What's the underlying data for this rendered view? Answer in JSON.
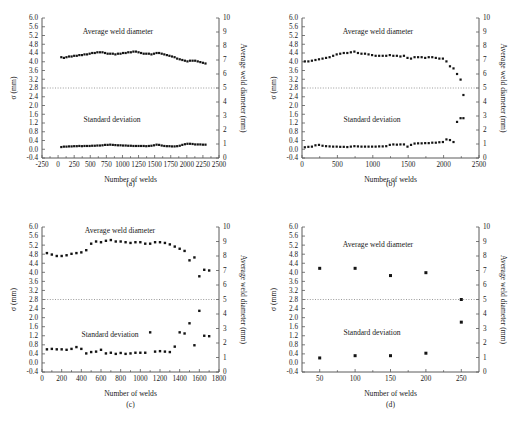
{
  "figure": {
    "name": "weld-diameter-monitoring-figure",
    "axis_titles": {
      "x": "Number of welds",
      "y_left": "σ (mm)",
      "y_right": "Average weld diameter (mm)"
    },
    "series_labels": {
      "upper": "Average weld diameter",
      "lower": "Standard deviation"
    },
    "reference_line_right_value": 5,
    "colors": {
      "marker": "#141414",
      "axis": "#5a5a5a",
      "reference": "#808080",
      "background": "#ffffff"
    }
  },
  "chart_data": [
    {
      "type": "scatter",
      "panel": "a",
      "caption": "(a)",
      "title": "",
      "xlabel": "Number of welds",
      "ylabel": "σ (mm)",
      "y2label": "Average weld diameter (mm)",
      "xlim": [
        -250,
        2500
      ],
      "ylim": [
        -0.4,
        6.0
      ],
      "y2lim": [
        0,
        10
      ],
      "xticks": [
        -250,
        0,
        250,
        500,
        750,
        1000,
        1250,
        1500,
        1750,
        2000,
        2250,
        2500
      ],
      "yticks": [
        -0.4,
        0.0,
        0.4,
        0.8,
        1.2,
        1.6,
        2.0,
        2.4,
        2.8,
        3.2,
        3.6,
        4.0,
        4.4,
        4.8,
        5.2,
        5.6,
        6.0
      ],
      "y2ticks": [
        0,
        1,
        2,
        3,
        4,
        5,
        6,
        7,
        8,
        9,
        10
      ],
      "grid": false,
      "reference_line": {
        "axis": "y2",
        "value": 5
      },
      "series": [
        {
          "name": "Average weld diameter",
          "axis": "right",
          "x": [
            50,
            90,
            130,
            170,
            210,
            250,
            290,
            330,
            370,
            410,
            450,
            490,
            530,
            570,
            610,
            650,
            690,
            730,
            770,
            810,
            850,
            890,
            930,
            970,
            1010,
            1050,
            1090,
            1130,
            1170,
            1210,
            1250,
            1290,
            1330,
            1370,
            1410,
            1450,
            1490,
            1530,
            1570,
            1610,
            1650,
            1690,
            1730,
            1770,
            1810,
            1850,
            1890,
            1930,
            1970,
            2010,
            2050,
            2090,
            2130,
            2170,
            2210,
            2250,
            2290
          ],
          "values": [
            7.2,
            7.15,
            7.2,
            7.25,
            7.25,
            7.3,
            7.3,
            7.35,
            7.35,
            7.4,
            7.4,
            7.45,
            7.5,
            7.5,
            7.55,
            7.55,
            7.55,
            7.5,
            7.45,
            7.45,
            7.45,
            7.4,
            7.45,
            7.45,
            7.5,
            7.5,
            7.55,
            7.55,
            7.6,
            7.6,
            7.55,
            7.5,
            7.45,
            7.45,
            7.45,
            7.4,
            7.45,
            7.5,
            7.5,
            7.45,
            7.4,
            7.35,
            7.3,
            7.25,
            7.2,
            7.1,
            7.05,
            7.0,
            6.95,
            6.9,
            6.95,
            6.95,
            6.95,
            6.9,
            6.85,
            6.8,
            6.75
          ]
        },
        {
          "name": "Standard deviation",
          "axis": "left",
          "x": [
            50,
            90,
            130,
            170,
            210,
            250,
            290,
            330,
            370,
            410,
            450,
            490,
            530,
            570,
            610,
            650,
            690,
            730,
            770,
            810,
            850,
            890,
            930,
            970,
            1010,
            1050,
            1090,
            1130,
            1170,
            1210,
            1250,
            1290,
            1330,
            1370,
            1410,
            1450,
            1490,
            1530,
            1570,
            1610,
            1650,
            1690,
            1730,
            1770,
            1810,
            1850,
            1890,
            1930,
            1970,
            2010,
            2050,
            2090,
            2130,
            2170,
            2210,
            2250,
            2290
          ],
          "values": [
            0.1,
            0.12,
            0.12,
            0.13,
            0.13,
            0.14,
            0.14,
            0.15,
            0.14,
            0.15,
            0.15,
            0.15,
            0.16,
            0.16,
            0.17,
            0.17,
            0.18,
            0.2,
            0.2,
            0.21,
            0.2,
            0.19,
            0.18,
            0.18,
            0.17,
            0.17,
            0.16,
            0.16,
            0.15,
            0.15,
            0.15,
            0.15,
            0.15,
            0.14,
            0.15,
            0.16,
            0.18,
            0.21,
            0.2,
            0.17,
            0.15,
            0.14,
            0.14,
            0.13,
            0.13,
            0.14,
            0.16,
            0.2,
            0.23,
            0.25,
            0.25,
            0.24,
            0.22,
            0.22,
            0.22,
            0.21,
            0.21
          ]
        }
      ]
    },
    {
      "type": "scatter",
      "panel": "b",
      "caption": "(b)",
      "title": "",
      "xlabel": "Number of welds",
      "ylabel": "σ (mm)",
      "y2label": "Average weld diameter (mm)",
      "xlim": [
        0,
        2500
      ],
      "ylim": [
        -0.4,
        6.0
      ],
      "y2lim": [
        0,
        10
      ],
      "xticks": [
        0,
        500,
        1000,
        1500,
        2000,
        2500
      ],
      "yticks": [
        -0.4,
        0.0,
        0.4,
        0.8,
        1.2,
        1.6,
        2.0,
        2.4,
        2.8,
        3.2,
        3.6,
        4.0,
        4.4,
        4.8,
        5.2,
        5.6,
        6.0
      ],
      "y2ticks": [
        0,
        1,
        2,
        3,
        4,
        5,
        6,
        7,
        8,
        9,
        10
      ],
      "grid": false,
      "reference_line": {
        "axis": "y2",
        "value": 5
      },
      "series": [
        {
          "name": "Average weld diameter",
          "axis": "right",
          "x": [
            40,
            90,
            140,
            190,
            240,
            290,
            340,
            390,
            440,
            490,
            540,
            590,
            640,
            690,
            740,
            790,
            840,
            890,
            940,
            990,
            1040,
            1090,
            1140,
            1190,
            1240,
            1290,
            1340,
            1390,
            1440,
            1490,
            1540,
            1590,
            1640,
            1690,
            1740,
            1790,
            1840,
            1890,
            1940,
            1990,
            2040,
            2090,
            2140,
            2190,
            2240,
            2280
          ],
          "values": [
            6.9,
            6.9,
            6.95,
            7.0,
            7.05,
            7.1,
            7.15,
            7.2,
            7.3,
            7.4,
            7.45,
            7.5,
            7.5,
            7.55,
            7.6,
            7.5,
            7.45,
            7.45,
            7.4,
            7.35,
            7.3,
            7.3,
            7.3,
            7.3,
            7.35,
            7.3,
            7.3,
            7.25,
            7.3,
            7.15,
            7.1,
            7.2,
            7.2,
            7.2,
            7.15,
            7.2,
            7.2,
            7.15,
            7.1,
            7.1,
            6.9,
            6.55,
            6.4,
            6.0,
            5.6,
            4.5
          ]
        },
        {
          "name": "Standard deviation",
          "axis": "left",
          "x": [
            40,
            90,
            140,
            190,
            240,
            290,
            340,
            390,
            440,
            490,
            540,
            590,
            640,
            690,
            740,
            790,
            840,
            890,
            940,
            990,
            1040,
            1090,
            1140,
            1190,
            1240,
            1290,
            1340,
            1390,
            1440,
            1490,
            1540,
            1590,
            1640,
            1690,
            1740,
            1790,
            1840,
            1890,
            1940,
            1990,
            2040,
            2090,
            2140,
            2190,
            2240,
            2280
          ],
          "values": [
            0.09,
            0.11,
            0.12,
            0.18,
            0.2,
            0.16,
            0.14,
            0.13,
            0.12,
            0.12,
            0.11,
            0.11,
            0.1,
            0.12,
            0.14,
            0.13,
            0.12,
            0.12,
            0.12,
            0.12,
            0.12,
            0.13,
            0.13,
            0.14,
            0.2,
            0.22,
            0.21,
            0.22,
            0.22,
            0.12,
            0.2,
            0.26,
            0.27,
            0.27,
            0.28,
            0.28,
            0.3,
            0.3,
            0.32,
            0.33,
            0.45,
            0.42,
            0.33,
            1.25,
            1.42,
            1.42
          ]
        }
      ]
    },
    {
      "type": "scatter",
      "panel": "c",
      "caption": "(c)",
      "title": "",
      "xlabel": "Number of welds",
      "ylabel": "σ (mm)",
      "y2label": "Average weld diameter (mm)",
      "xlim": [
        0,
        1800
      ],
      "ylim": [
        -0.4,
        6.0
      ],
      "y2lim": [
        0,
        10
      ],
      "xticks": [
        0,
        200,
        400,
        600,
        800,
        1000,
        1200,
        1400,
        1600,
        1800
      ],
      "yticks": [
        -0.4,
        0.0,
        0.4,
        0.8,
        1.2,
        1.6,
        2.0,
        2.4,
        2.8,
        3.2,
        3.6,
        4.0,
        4.4,
        4.8,
        5.2,
        5.6,
        6.0
      ],
      "y2ticks": [
        0,
        1,
        2,
        3,
        4,
        5,
        6,
        7,
        8,
        9,
        10
      ],
      "grid": false,
      "reference_line": {
        "axis": "y2",
        "value": 5
      },
      "series": [
        {
          "name": "Average weld diameter",
          "axis": "right",
          "x": [
            50,
            100,
            150,
            200,
            250,
            300,
            350,
            400,
            450,
            500,
            550,
            600,
            650,
            700,
            750,
            800,
            850,
            900,
            950,
            1000,
            1050,
            1100,
            1150,
            1200,
            1250,
            1300,
            1350,
            1400,
            1450,
            1500,
            1550,
            1600,
            1650,
            1700
          ],
          "values": [
            8.2,
            8.1,
            8.0,
            8.0,
            8.05,
            8.15,
            8.2,
            8.25,
            8.4,
            8.85,
            9.0,
            8.95,
            9.05,
            9.1,
            9.0,
            9.0,
            8.95,
            8.9,
            8.95,
            8.95,
            8.85,
            8.85,
            8.95,
            8.95,
            8.9,
            8.8,
            8.65,
            8.5,
            8.35,
            7.7,
            7.9,
            6.6,
            7.05,
            7.0
          ]
        },
        {
          "name": "Standard deviation",
          "axis": "left",
          "x": [
            50,
            100,
            150,
            200,
            250,
            300,
            350,
            400,
            450,
            500,
            550,
            600,
            650,
            700,
            750,
            800,
            850,
            900,
            950,
            1000,
            1050,
            1100,
            1150,
            1200,
            1250,
            1300,
            1350,
            1400,
            1450,
            1500,
            1550,
            1600,
            1650,
            1700
          ],
          "values": [
            0.6,
            0.62,
            0.6,
            0.6,
            0.58,
            0.62,
            0.7,
            0.62,
            0.42,
            0.48,
            0.5,
            0.58,
            0.42,
            0.45,
            0.4,
            0.44,
            0.4,
            0.42,
            0.45,
            0.45,
            0.45,
            1.35,
            0.5,
            0.52,
            0.5,
            0.48,
            0.72,
            1.35,
            1.3,
            1.75,
            0.78,
            2.3,
            1.2,
            1.18
          ]
        }
      ]
    },
    {
      "type": "scatter",
      "panel": "d",
      "caption": "(d)",
      "title": "",
      "xlabel": "Number of welds",
      "ylabel": "σ (mm)",
      "y2label": "Average weld diameter (mm)",
      "xlim": [
        25,
        275
      ],
      "ylim": [
        -0.4,
        6.0
      ],
      "y2lim": [
        0,
        10
      ],
      "xticks": [
        50,
        100,
        150,
        200,
        250
      ],
      "yticks": [
        -0.4,
        0.0,
        0.4,
        0.8,
        1.2,
        1.6,
        2.0,
        2.4,
        2.8,
        3.2,
        3.6,
        4.0,
        4.4,
        4.8,
        5.2,
        5.6,
        6.0
      ],
      "y2ticks": [
        0,
        1,
        2,
        3,
        4,
        5,
        6,
        7,
        8,
        9,
        10
      ],
      "grid": false,
      "reference_line": {
        "axis": "y2",
        "value": 5
      },
      "series": [
        {
          "name": "Average weld diameter",
          "axis": "right",
          "x": [
            50,
            100,
            150,
            200,
            250
          ],
          "values": [
            7.15,
            7.15,
            6.65,
            6.85,
            5.0
          ]
        },
        {
          "name": "Standard deviation",
          "axis": "left",
          "x": [
            50,
            100,
            150,
            200,
            250
          ],
          "values": [
            0.22,
            0.32,
            0.32,
            0.43,
            1.8
          ]
        }
      ]
    }
  ]
}
